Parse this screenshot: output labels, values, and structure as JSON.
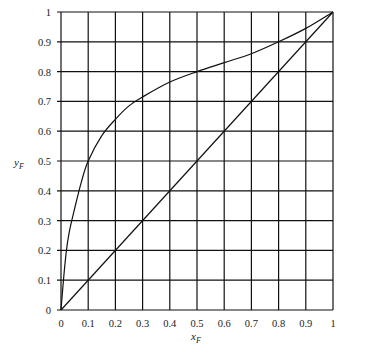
{
  "chart_data": {
    "type": "line",
    "title": "",
    "xlabel": "x_F",
    "ylabel": "y_F",
    "xlim": [
      0,
      1
    ],
    "ylim": [
      0,
      1
    ],
    "grid": true,
    "legend": null,
    "x_ticks": [
      "0",
      "0.1",
      "0.2",
      "0.3",
      "0.4",
      "0.5",
      "0.6",
      "0.7",
      "0.8",
      "0.9",
      "1"
    ],
    "y_ticks": [
      "0",
      "0.1",
      "0.2",
      "0.3",
      "0.4",
      "0.5",
      "0.6",
      "0.7",
      "0.8",
      "0.9",
      "1"
    ],
    "series": [
      {
        "name": "equilibrium curve",
        "x": [
          0,
          0.01,
          0.02,
          0.03,
          0.05,
          0.075,
          0.1,
          0.15,
          0.2,
          0.25,
          0.3,
          0.4,
          0.5,
          0.6,
          0.7,
          0.8,
          0.9,
          1.0
        ],
        "y": [
          0,
          0.11,
          0.2,
          0.26,
          0.34,
          0.43,
          0.5,
          0.585,
          0.64,
          0.685,
          0.715,
          0.765,
          0.8,
          0.83,
          0.86,
          0.9,
          0.945,
          1.0
        ]
      },
      {
        "name": "diagonal y=x",
        "x": [
          0,
          1
        ],
        "y": [
          0,
          1
        ]
      }
    ]
  },
  "labels": {
    "x_main": "x",
    "x_sub": "F",
    "y_main": "y",
    "y_sub": "F"
  }
}
